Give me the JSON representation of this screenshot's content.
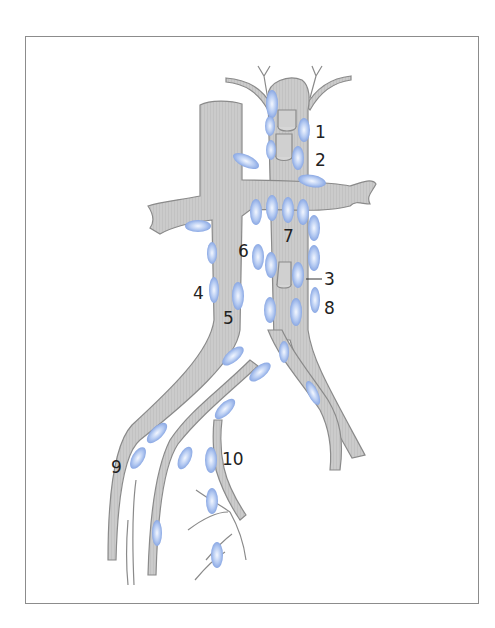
{
  "figure": {
    "type": "anatomical-diagram",
    "colors": {
      "vessel_fill": "#c9c9c9",
      "vessel_stroke": "#8a8a8a",
      "node_fill": "#9bb8ee",
      "node_highlight": "#eef4ff",
      "frame": "#8c8c8c",
      "label": "#222222"
    },
    "labels": [
      {
        "id": "1",
        "text": "1",
        "x": 315,
        "y": 124
      },
      {
        "id": "2",
        "text": "2",
        "x": 315,
        "y": 152
      },
      {
        "id": "3",
        "text": "3",
        "x": 324,
        "y": 271
      },
      {
        "id": "4",
        "text": "4",
        "x": 193,
        "y": 285
      },
      {
        "id": "5",
        "text": "5",
        "x": 223,
        "y": 310
      },
      {
        "id": "6",
        "text": "6",
        "x": 238,
        "y": 243
      },
      {
        "id": "7",
        "text": "7",
        "x": 283,
        "y": 228
      },
      {
        "id": "8",
        "text": "8",
        "x": 324,
        "y": 300
      },
      {
        "id": "9",
        "text": "9",
        "x": 111,
        "y": 459
      },
      {
        "id": "10",
        "text": "10",
        "x": 222,
        "y": 451
      }
    ]
  }
}
